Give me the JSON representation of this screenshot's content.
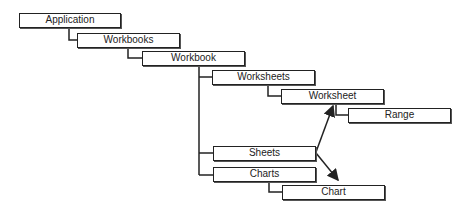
{
  "diagram": {
    "type": "object-model-hierarchy",
    "nodes": [
      {
        "id": "application",
        "label": "Application",
        "x": 19,
        "y": 13
      },
      {
        "id": "workbooks",
        "label": "Workbooks",
        "x": 77,
        "y": 33
      },
      {
        "id": "workbook",
        "label": "Workbook",
        "x": 142,
        "y": 51
      },
      {
        "id": "worksheets",
        "label": "Worksheets",
        "x": 212,
        "y": 70
      },
      {
        "id": "worksheet",
        "label": "Worksheet",
        "x": 281,
        "y": 89
      },
      {
        "id": "range",
        "label": "Range",
        "x": 348,
        "y": 108
      },
      {
        "id": "sheets",
        "label": "Sheets",
        "x": 213,
        "y": 146
      },
      {
        "id": "charts",
        "label": "Charts",
        "x": 213,
        "y": 167
      },
      {
        "id": "chart",
        "label": "Chart",
        "x": 282,
        "y": 185
      }
    ],
    "edges": [
      {
        "from": "application",
        "to": "workbooks",
        "style": "elbow"
      },
      {
        "from": "workbooks",
        "to": "workbook",
        "style": "elbow"
      },
      {
        "from": "workbook",
        "to": "worksheets",
        "style": "elbow"
      },
      {
        "from": "workbook",
        "to": "sheets",
        "style": "elbow"
      },
      {
        "from": "workbook",
        "to": "charts",
        "style": "elbow"
      },
      {
        "from": "worksheets",
        "to": "worksheet",
        "style": "elbow"
      },
      {
        "from": "worksheet",
        "to": "range",
        "style": "elbow"
      },
      {
        "from": "charts",
        "to": "chart",
        "style": "elbow"
      },
      {
        "from": "sheets",
        "to": "worksheet",
        "style": "arrow"
      },
      {
        "from": "sheets",
        "to": "chart",
        "style": "arrow"
      }
    ]
  }
}
